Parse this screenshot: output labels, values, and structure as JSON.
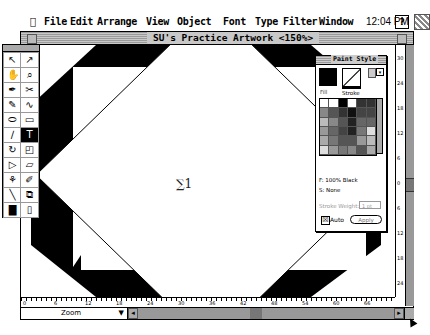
{
  "menubar": {
    "apple": "",
    "items": [
      "File",
      "Edit",
      "Arrange",
      "View",
      "Object",
      "Font",
      "Type",
      "Filter",
      "Window"
    ],
    "clock": "12:04 PM",
    "help_icon": "?",
    "app_icon": "illustrator-app-icon"
  },
  "window": {
    "title": "SU's Practice Artwork <150%>"
  },
  "canvas": {
    "label": "∑1",
    "colors": {
      "octagon_fill": "#000000",
      "diamond_fill": "#ffffff",
      "background": "#ffffff"
    }
  },
  "toolbox": {
    "tools": [
      {
        "name": "selection-tool",
        "glyph": "↖"
      },
      {
        "name": "direct-selection-tool",
        "glyph": "↗"
      },
      {
        "name": "hand-tool",
        "glyph": "✋"
      },
      {
        "name": "zoom-tool",
        "glyph": "⌕"
      },
      {
        "name": "pen-tool",
        "glyph": "✒"
      },
      {
        "name": "scissors-tool",
        "glyph": "✂"
      },
      {
        "name": "brush-tool",
        "glyph": "✎"
      },
      {
        "name": "freehand-tool",
        "glyph": "∿"
      },
      {
        "name": "ellipse-tool",
        "glyph": "⬭"
      },
      {
        "name": "rectangle-tool",
        "glyph": "▭"
      },
      {
        "name": "blend-tool",
        "glyph": "∕"
      },
      {
        "name": "type-tool",
        "glyph": "T"
      },
      {
        "name": "rotate-tool",
        "glyph": "↻"
      },
      {
        "name": "scale-tool",
        "glyph": "◰"
      },
      {
        "name": "reflect-tool",
        "glyph": "▷"
      },
      {
        "name": "shear-tool",
        "glyph": "▱"
      },
      {
        "name": "paint-bucket-tool",
        "glyph": "⚘"
      },
      {
        "name": "eyedropper-tool",
        "glyph": "✐"
      },
      {
        "name": "measure-tool",
        "glyph": "╲"
      },
      {
        "name": "gradient-tool",
        "glyph": "⧉"
      },
      {
        "name": "graph-tool",
        "glyph": "▇"
      },
      {
        "name": "page-tool",
        "glyph": "▯"
      }
    ],
    "selected_index": 11
  },
  "paint_style": {
    "title": "Paint Style",
    "fill_label": "Fill",
    "stroke_label": "Stroke",
    "fill_info": "F: 100% Black",
    "stroke_info": "S: None",
    "stroke_weight_label": "Stroke Weight:",
    "stroke_weight_value": "1 pt",
    "auto_label": "Auto",
    "auto_checked": "☒",
    "apply_label": "Apply",
    "swatches": [
      "#ffffff",
      "#ffffff",
      "#000000",
      "#ffffff",
      "#333333",
      "#333333",
      "#888888",
      "#555555",
      "#333333",
      "#111111",
      "#444444",
      "#444444",
      "#bbbbbb",
      "#888888",
      "#555555",
      "#222222",
      "#666666",
      "#666666",
      "#999999",
      "#666666",
      "#444444",
      "#222222",
      "#777777",
      "#dddddd",
      "#aaaaaa",
      "#777777",
      "#555555",
      "#555555",
      "#999999",
      "#bbbbbb",
      "#dddddd",
      "#999999",
      "#777777",
      "#888888",
      "#555555",
      "#aaaaaa"
    ]
  },
  "rulers": {
    "horizontal": [
      "0",
      "6",
      "12",
      "18",
      "24",
      "30",
      "36",
      "42",
      "48",
      "54",
      "60",
      "66"
    ],
    "vertical": [
      "30",
      "24",
      "18",
      "12",
      "6",
      "0",
      "6",
      "12",
      "18",
      "24",
      "30"
    ]
  },
  "status": {
    "zoom_label": "Zoom",
    "zoom_dropdown": "▼"
  }
}
